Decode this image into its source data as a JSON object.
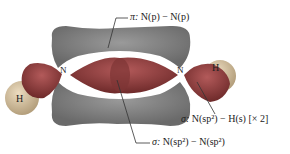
{
  "figure": {
    "caption_fragment": "",
    "molecule": "N2H2 (diazene)",
    "atoms": {
      "nitrogen_left": "N",
      "nitrogen_right": "N",
      "hydrogen_left": "H",
      "hydrogen_right": "H"
    },
    "labels": {
      "pi_bond": {
        "prefix": "π: ",
        "text": "N(p) − N(p)"
      },
      "sigma_nh": {
        "prefix": "σ: ",
        "text": "N(sp²) − H(s) [× 2]"
      },
      "sigma_nn": {
        "prefix": "σ: ",
        "text": "N(sp²) − N(sp²)"
      }
    },
    "colors": {
      "pi_lobe": "#7a7a7a",
      "sigma_lobe": "#8a3a3a",
      "hydrogen": "#c9b89a",
      "leader_line": "#333333"
    }
  }
}
